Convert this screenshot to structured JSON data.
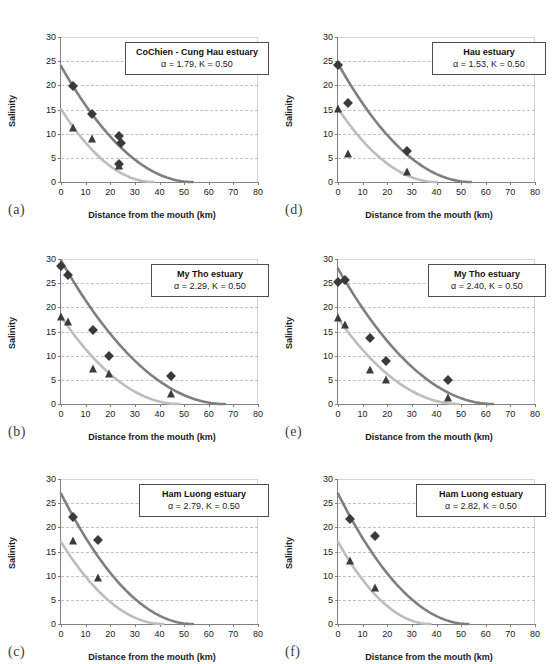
{
  "figure": {
    "axis": {
      "xlabel": "Distance from the mouth (km)",
      "ylabel": "Salinity",
      "xticks": [
        0,
        10,
        20,
        30,
        40,
        50,
        60,
        70,
        80
      ],
      "yticks": [
        0,
        5,
        10,
        15,
        20,
        25,
        30
      ],
      "xlim": [
        0,
        80
      ],
      "ylim": [
        0,
        30
      ],
      "grid": "horizontal-dashed"
    },
    "colors": {
      "upper_curve": "#7f7f7f",
      "lower_curve": "#bdbdbd",
      "marker": "#3a3a3a",
      "grid": "#bfbfc8",
      "axis": "#808080"
    }
  },
  "chart_data": [
    {
      "type": "scatter",
      "panel": "(a)",
      "title": "CoChien - Cung Hau estuary",
      "params": "α = 1.79, K = 0.50",
      "alpha": 1.79,
      "K": 0.5,
      "xlabel": "Distance from the mouth (km)",
      "ylabel": "Salinity",
      "xlim": [
        0,
        80
      ],
      "ylim": [
        0,
        30
      ],
      "series": [
        {
          "name": "high-salinity-observations",
          "marker": "diamond",
          "points": [
            [
              5,
              19.8
            ],
            [
              12.5,
              14.0
            ],
            [
              23.5,
              9.5
            ],
            [
              24.5,
              8.1
            ],
            [
              23.5,
              3.8
            ]
          ]
        },
        {
          "name": "low-salinity-observations",
          "marker": "triangle",
          "points": [
            [
              5,
              11.1
            ],
            [
              12.5,
              8.8
            ],
            [
              23.5,
              3.3
            ]
          ]
        },
        {
          "name": "upper-fitted-curve",
          "curve": {
            "s0": 24.0,
            "L": 53.5,
            "shape": 2.0
          }
        },
        {
          "name": "lower-fitted-curve",
          "curve": {
            "s0": 15.1,
            "L": 37.5,
            "shape": 2.0
          }
        }
      ]
    },
    {
      "type": "scatter",
      "panel": "(b)",
      "title": "My Tho estuary",
      "params": "α = 2.29, K = 0.50",
      "alpha": 2.29,
      "K": 0.5,
      "xlabel": "Distance from the mouth (km)",
      "ylabel": "Salinity",
      "xlim": [
        0,
        80
      ],
      "ylim": [
        0,
        30
      ],
      "series": [
        {
          "name": "high-salinity-observations",
          "marker": "diamond",
          "points": [
            [
              0,
              28.5
            ],
            [
              3,
              26.7
            ],
            [
              13,
              15.4
            ],
            [
              19.5,
              9.9
            ],
            [
              44.5,
              5.7
            ]
          ]
        },
        {
          "name": "low-salinity-observations",
          "marker": "triangle",
          "points": [
            [
              0,
              18.0
            ],
            [
              3,
              16.9
            ],
            [
              13,
              7.2
            ],
            [
              19.5,
              6.3
            ],
            [
              44.5,
              2.0
            ]
          ]
        },
        {
          "name": "upper-fitted-curve",
          "curve": {
            "s0": 29.7,
            "L": 66.5,
            "shape": 2.0
          }
        },
        {
          "name": "lower-fitted-curve",
          "curve": {
            "s0": 18.1,
            "L": 48.0,
            "shape": 2.0
          }
        }
      ]
    },
    {
      "type": "scatter",
      "panel": "(c)",
      "title": "Ham Luong estuary",
      "params": "α = 2.79, K = 0.50",
      "alpha": 2.79,
      "K": 0.5,
      "xlabel": "Distance from the mouth (km)",
      "ylabel": "Salinity",
      "xlim": [
        0,
        80
      ],
      "ylim": [
        0,
        30
      ],
      "series": [
        {
          "name": "high-salinity-observations",
          "marker": "diamond",
          "points": [
            [
              5,
              22.2
            ],
            [
              15,
              17.3
            ]
          ]
        },
        {
          "name": "low-salinity-observations",
          "marker": "triangle",
          "points": [
            [
              5,
              17.1
            ],
            [
              15,
              9.6
            ]
          ]
        },
        {
          "name": "upper-fitted-curve",
          "curve": {
            "s0": 27.0,
            "L": 53.5,
            "shape": 2.0
          }
        },
        {
          "name": "lower-fitted-curve",
          "curve": {
            "s0": 17.0,
            "L": 41.5,
            "shape": 2.0
          }
        }
      ]
    },
    {
      "type": "scatter",
      "panel": "(d)",
      "title": "Hau estuary",
      "params": "α = 1.53, K = 0.50",
      "alpha": 1.53,
      "K": 0.5,
      "xlabel": "Distance from the mouth (km)",
      "ylabel": "Salinity",
      "xlim": [
        0,
        80
      ],
      "ylim": [
        0,
        30
      ],
      "series": [
        {
          "name": "high-salinity-observations",
          "marker": "diamond",
          "points": [
            [
              0,
              24.3
            ],
            [
              4,
              16.3
            ],
            [
              28,
              6.5
            ]
          ]
        },
        {
          "name": "low-salinity-observations",
          "marker": "triangle",
          "points": [
            [
              0,
              15.2
            ],
            [
              4,
              5.7
            ],
            [
              28,
              2.0
            ]
          ]
        },
        {
          "name": "upper-fitted-curve",
          "curve": {
            "s0": 24.5,
            "L": 54.0,
            "shape": 2.0
          }
        },
        {
          "name": "lower-fitted-curve",
          "curve": {
            "s0": 15.2,
            "L": 40.0,
            "shape": 2.0
          }
        }
      ]
    },
    {
      "type": "scatter",
      "panel": "(e)",
      "title": "My Tho estuary",
      "params": "α = 2.40, K = 0.50",
      "alpha": 2.4,
      "K": 0.5,
      "xlabel": "Distance from the mouth (km)",
      "ylabel": "Salinity",
      "xlim": [
        0,
        80
      ],
      "ylim": [
        0,
        30
      ],
      "series": [
        {
          "name": "high-salinity-observations",
          "marker": "diamond",
          "points": [
            [
              0,
              25.3
            ],
            [
              3,
              25.7
            ],
            [
              13,
              13.6
            ],
            [
              19.5,
              9.0
            ],
            [
              44.5,
              5.0
            ]
          ]
        },
        {
          "name": "low-salinity-observations",
          "marker": "triangle",
          "points": [
            [
              0,
              17.7
            ],
            [
              3,
              16.3
            ],
            [
              13,
              7.1
            ],
            [
              19.5,
              5.0
            ],
            [
              44.5,
              1.2
            ]
          ]
        },
        {
          "name": "upper-fitted-curve",
          "curve": {
            "s0": 28.0,
            "L": 63.0,
            "shape": 2.0
          }
        },
        {
          "name": "lower-fitted-curve",
          "curve": {
            "s0": 17.7,
            "L": 49.0,
            "shape": 2.0
          }
        }
      ]
    },
    {
      "type": "scatter",
      "panel": "(f)",
      "title": "Ham Luong estuary",
      "params": "α = 2.82, K = 0.50",
      "alpha": 2.82,
      "K": 0.5,
      "xlabel": "Distance from the mouth (km)",
      "ylabel": "Salinity",
      "xlim": [
        0,
        80
      ],
      "ylim": [
        0,
        30
      ],
      "series": [
        {
          "name": "high-salinity-observations",
          "marker": "diamond",
          "points": [
            [
              5,
              21.7
            ],
            [
              15,
              18.3
            ]
          ]
        },
        {
          "name": "low-salinity-observations",
          "marker": "triangle",
          "points": [
            [
              5,
              13.0
            ],
            [
              15,
              7.4
            ]
          ]
        },
        {
          "name": "upper-fitted-curve",
          "curve": {
            "s0": 27.0,
            "L": 53.0,
            "shape": 2.0
          }
        },
        {
          "name": "lower-fitted-curve",
          "curve": {
            "s0": 17.0,
            "L": 37.5,
            "shape": 2.0
          }
        }
      ]
    }
  ]
}
